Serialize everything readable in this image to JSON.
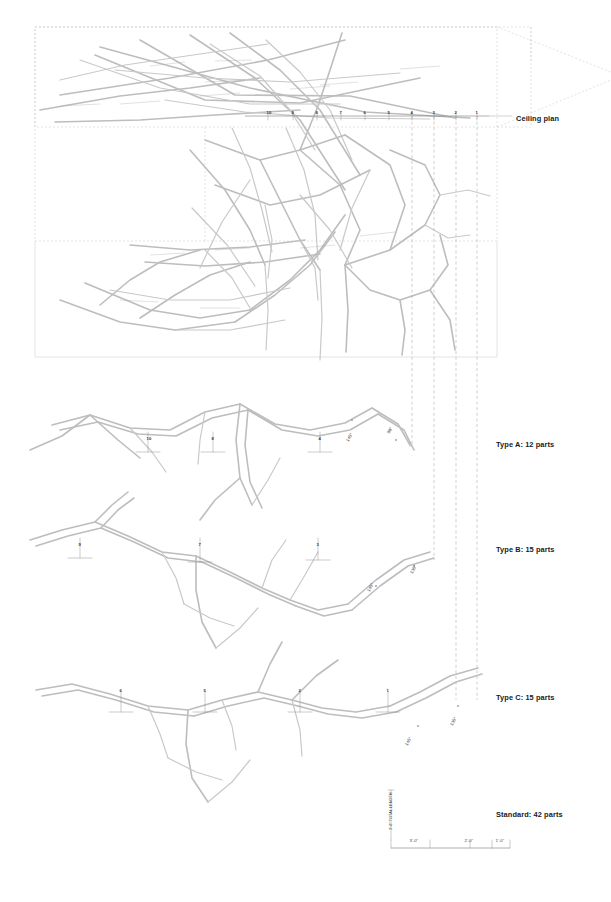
{
  "sheet": {
    "background": "#ffffff",
    "line_color": "#b9b9b9",
    "thin_line_color": "#cfcfcf",
    "dark_line_color": "#8f8f8f",
    "dash_color": "#9a9a9a",
    "text_color": "#1a1a1a"
  },
  "labels": {
    "ceiling_plan": "Ceiling plan",
    "type_a": "Type A: 12 parts",
    "type_b": "Type B: 15 parts",
    "type_c": "Type C: 15 parts",
    "standard": "Standard: 42 parts"
  },
  "ceiling_grid": {
    "numbers": [
      "10",
      "9",
      "8",
      "7",
      "6",
      "5",
      "4",
      "3",
      "2",
      "1"
    ],
    "x_positions": [
      268,
      293,
      317,
      341,
      365,
      389,
      412,
      434,
      456,
      477
    ],
    "y": 110
  },
  "type_a": {
    "title": "Type A: 12 parts",
    "markers": [
      "10",
      "8",
      "4"
    ],
    "marker_x": [
      148,
      213,
      320
    ],
    "marker_y": 436,
    "angles": [
      "145°",
      "90°"
    ],
    "angle_pos": [
      [
        345,
        440
      ],
      [
        386,
        432
      ]
    ]
  },
  "type_b": {
    "title": "Type B: 15 parts",
    "markers": [
      "9",
      "7",
      "3"
    ],
    "marker_x": [
      80,
      200,
      318
    ],
    "marker_y": 542,
    "angles": [
      "145°",
      "135°"
    ],
    "angle_pos": [
      [
        366,
        590
      ],
      [
        409,
        572
      ]
    ]
  },
  "type_c": {
    "title": "Type C: 15 parts",
    "markers": [
      "6",
      "5",
      "2",
      "1"
    ],
    "marker_x": [
      121,
      205,
      300,
      388
    ],
    "marker_y": 688,
    "angles": [
      "145°",
      "135°"
    ],
    "angle_pos": [
      [
        404,
        744
      ],
      [
        449,
        724
      ]
    ]
  },
  "scale_bar": {
    "vertical_note": "3'-6\" TOTAL LENGTH",
    "ticks": [
      "3'-0\"",
      "2'-0\"",
      "1'-0\""
    ],
    "tick_x": [
      411,
      466,
      497
    ],
    "baseline_y": 848,
    "left": 391,
    "right": 510
  },
  "standard": {
    "title": "Standard: 42 parts"
  }
}
